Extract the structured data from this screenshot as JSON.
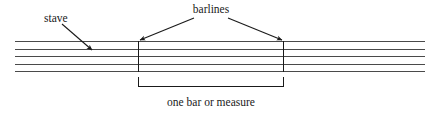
{
  "figure": {
    "background_color": "#ffffff"
  },
  "labels": {
    "stave": "stave",
    "barlines": "barlines",
    "measure": "one bar or measure"
  },
  "colors": {
    "staff_line": "#4a4a4a",
    "barline": "#1a1a1a",
    "text": "#1a1a1a",
    "arrow": "#1a1a1a",
    "bracket": "#1a1a1a"
  },
  "staff": {
    "line_count": 5,
    "x_start": 15,
    "x_end": 425,
    "line_y": [
      41,
      48.5,
      56,
      63.5,
      71
    ]
  },
  "barlines": {
    "count": 2,
    "x_positions": [
      138,
      284
    ],
    "y_top": 41,
    "y_bottom": 71
  },
  "bracket": {
    "x_start": 138,
    "x_end": 284,
    "y": 86,
    "tick_height": 9
  },
  "arrows": [
    {
      "name": "stave-arrow",
      "from_x": 62,
      "from_y": 24,
      "to_x": 93,
      "to_y": 51
    },
    {
      "name": "barline-left-arrow",
      "from_x": 194,
      "from_y": 18,
      "to_x": 139,
      "to_y": 41
    },
    {
      "name": "barline-right-arrow",
      "from_x": 228,
      "from_y": 18,
      "to_x": 283,
      "to_y": 41
    }
  ],
  "text_positions": {
    "stave": {
      "x": 44,
      "y": 22
    },
    "barlines": {
      "x": 185,
      "y": 14
    },
    "measure": {
      "x": 211,
      "y": 106
    }
  }
}
